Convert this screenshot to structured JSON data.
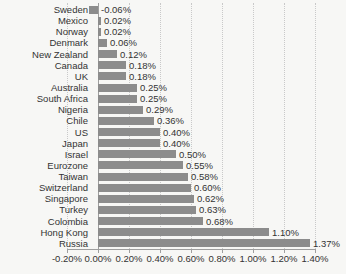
{
  "chart_data": {
    "type": "bar",
    "orientation": "horizontal",
    "title": "",
    "xlabel": "",
    "ylabel": "",
    "legend": "none",
    "grid": "vertical-dotted",
    "categories": [
      "Sweden",
      "Mexico",
      "Norway",
      "Denmark",
      "New Zealand",
      "Canada",
      "UK",
      "Australia",
      "South Africa",
      "Nigeria",
      "Chile",
      "US",
      "Japan",
      "Israel",
      "Eurozone",
      "Taiwan",
      "Switzerland",
      "Singapore",
      "Turkey",
      "Colombia",
      "Hong Kong",
      "Russia"
    ],
    "values": [
      -0.06,
      0.02,
      0.02,
      0.06,
      0.12,
      0.18,
      0.18,
      0.25,
      0.25,
      0.29,
      0.36,
      0.4,
      0.4,
      0.5,
      0.55,
      0.58,
      0.6,
      0.62,
      0.63,
      0.68,
      1.1,
      1.37
    ],
    "value_labels": [
      "-0.06%",
      "0.02%",
      "0.02%",
      "0.06%",
      "0.12%",
      "0.18%",
      "0.18%",
      "0.25%",
      "0.25%",
      "0.29%",
      "0.36%",
      "0.40%",
      "0.40%",
      "0.50%",
      "0.55%",
      "0.58%",
      "0.60%",
      "0.62%",
      "0.63%",
      "0.68%",
      "1.10%",
      "1.37%"
    ],
    "x_axis": {
      "min": -0.2,
      "max": 1.4,
      "tick_step": 0.2,
      "tick_labels": [
        "-0.20%",
        "0.00%",
        "0.20%",
        "0.40%",
        "0.60%",
        "0.80%",
        "1.00%",
        "1.20%",
        "1.40%"
      ]
    },
    "colors": {
      "bar": "#8c8c8c",
      "gridline": "#c9c9c9",
      "axis_line": "#9e9e9e",
      "text": "#333333",
      "background": "#f7f7f5"
    }
  }
}
